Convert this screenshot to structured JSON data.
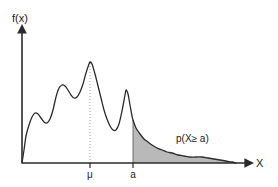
{
  "chart_data": {
    "type": "area",
    "title": "",
    "xlabel": "X",
    "ylabel": "f(x)",
    "grid": false,
    "legend_position": "none",
    "axis_origin_label": "",
    "annotations": [
      {
        "name": "tail-probability-label",
        "text": "p(X≥ a)",
        "x": 176,
        "y": 142
      }
    ],
    "tick_labels": {
      "x": [
        {
          "name": "mu",
          "text": "μ",
          "x": 90
        },
        {
          "name": "a",
          "text": "a",
          "x": 133
        }
      ],
      "y": []
    },
    "markers": [
      {
        "name": "mean-guide-line",
        "kind": "vertical-dotted",
        "x": 90,
        "from_y": 163,
        "to_y": 62
      },
      {
        "name": "threshold-edge",
        "kind": "vertical-solid",
        "x": 133,
        "from_y": 163,
        "to_y": 120
      }
    ],
    "shaded_region": {
      "name": "tail-area",
      "from_x": 133,
      "to_x": 236,
      "fill": "#b9b9b9",
      "description": "area under density curve to the right of a"
    },
    "curve": {
      "name": "density-curve",
      "stroke": "#2b2b2b",
      "points": [
        [
          22,
          163
        ],
        [
          24,
          150
        ],
        [
          26,
          136
        ],
        [
          29,
          125
        ],
        [
          32,
          117
        ],
        [
          35,
          113
        ],
        [
          38,
          114
        ],
        [
          41,
          118
        ],
        [
          44,
          122
        ],
        [
          47,
          123
        ],
        [
          50,
          119
        ],
        [
          53,
          110
        ],
        [
          56,
          97
        ],
        [
          59,
          88
        ],
        [
          62,
          85
        ],
        [
          65,
          86
        ],
        [
          68,
          90
        ],
        [
          71,
          95
        ],
        [
          74,
          98
        ],
        [
          77,
          97
        ],
        [
          80,
          92
        ],
        [
          83,
          84
        ],
        [
          86,
          73
        ],
        [
          89,
          64
        ],
        [
          90,
          62
        ],
        [
          92,
          64
        ],
        [
          95,
          74
        ],
        [
          98,
          86
        ],
        [
          101,
          98
        ],
        [
          104,
          110
        ],
        [
          107,
          119
        ],
        [
          110,
          126
        ],
        [
          113,
          130
        ],
        [
          116,
          130
        ],
        [
          119,
          124
        ],
        [
          122,
          111
        ],
        [
          125,
          95
        ],
        [
          126,
          90
        ],
        [
          128,
          94
        ],
        [
          130,
          105
        ],
        [
          132,
          116
        ],
        [
          133,
          120
        ],
        [
          136,
          128
        ],
        [
          140,
          134
        ],
        [
          144,
          139
        ],
        [
          148,
          142
        ],
        [
          152,
          145
        ],
        [
          157,
          148
        ],
        [
          162,
          150
        ],
        [
          167,
          152
        ],
        [
          172,
          153
        ],
        [
          178,
          155
        ],
        [
          184,
          156
        ],
        [
          190,
          157
        ],
        [
          196,
          157
        ],
        [
          202,
          157
        ],
        [
          208,
          158
        ],
        [
          214,
          159
        ],
        [
          220,
          160
        ],
        [
          226,
          161
        ],
        [
          232,
          162
        ],
        [
          236,
          163
        ]
      ]
    },
    "axes": {
      "x_axis": {
        "from": [
          22,
          163
        ],
        "to": [
          250,
          163
        ],
        "arrow": true
      },
      "y_axis": {
        "from": [
          22,
          163
        ],
        "to": [
          22,
          28
        ],
        "arrow": true
      },
      "stroke": "#2b2b2b"
    },
    "colors": {
      "stroke": "#2b2b2b",
      "shade": "#b9b9b9",
      "background": "#ffffff",
      "text": "#1a1a1a"
    }
  }
}
